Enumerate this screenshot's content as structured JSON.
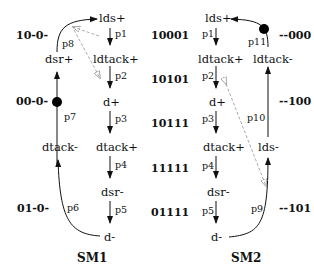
{
  "sm1": {
    "title": "SM1",
    "signals": {
      "lds_plus": "lds+",
      "ldtack_plus": "ldtack+",
      "d_plus": "d+",
      "dtack_plus": "dtack+",
      "dsr_minus": "dsr-",
      "d_minus": "d-",
      "dtack_minus": "dtack-",
      "dsr_plus": "dsr+"
    },
    "places": {
      "p1": "p1",
      "p2": "p2",
      "p3": "p3",
      "p4": "p4",
      "p5": "p5",
      "p6": "p6",
      "p7": "p7",
      "p8": "p8"
    },
    "codes": [
      "10-0-",
      "00-0-",
      "01-0-"
    ],
    "token_place": "p7"
  },
  "sm2": {
    "title": "SM2",
    "signals": {
      "lds_plus": "lds+",
      "ldtack_plus": "ldtack+",
      "d_plus": "d+",
      "dtack_plus": "dtack+",
      "dsr_minus": "dsr-",
      "d_minus": "d-",
      "lds_minus": "lds-",
      "ldtack_minus": "ldtack-"
    },
    "places": {
      "p1": "p1",
      "p2": "p2",
      "p3": "p3",
      "p4": "p4",
      "p5": "p5",
      "p9": "p9",
      "p10": "p10",
      "p11": "p11"
    },
    "codes_left": [
      "10001",
      "10101",
      "10111",
      "11111",
      "01111"
    ],
    "codes_right": [
      "--000",
      "--100",
      "--101"
    ],
    "token_place": "p11"
  },
  "colors": {
    "edge": "#111111",
    "dashed": "#aaaaaa",
    "token": "#000000"
  }
}
